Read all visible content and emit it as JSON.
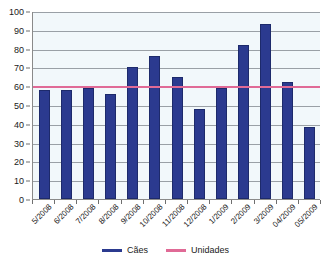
{
  "chart_data": {
    "type": "bar",
    "title": "",
    "xlabel": "",
    "ylabel": "",
    "ylim": [
      0,
      100
    ],
    "ytick_step": 10,
    "yticks": [
      0,
      10,
      20,
      30,
      40,
      50,
      60,
      70,
      80,
      90,
      100
    ],
    "grid": true,
    "legend_position": "bottom",
    "categories": [
      "5/2008",
      "6/2008",
      "7/2008",
      "8/2008",
      "9/2008",
      "10/2008",
      "11/2008",
      "12/2008",
      "1/2009",
      "2/2009",
      "3/2009",
      "04/2009",
      "05/2009"
    ],
    "series": [
      {
        "name": "Cães",
        "type": "bar",
        "color": "#2b3a8f",
        "values": [
          58,
          58,
          59,
          56,
          70,
          76,
          65,
          48,
          59,
          82,
          93,
          62,
          38.5
        ]
      },
      {
        "name": "Unidades",
        "type": "line",
        "color": "#e06a96",
        "constant_value": 60,
        "values": [
          60,
          60,
          60,
          60,
          60,
          60,
          60,
          60,
          60,
          60,
          60,
          60,
          60
        ]
      }
    ]
  },
  "legend": {
    "items": [
      {
        "label": "Cães",
        "color": "#2b3a8f",
        "style": "bar"
      },
      {
        "label": "Unidades",
        "color": "#e06a96",
        "style": "line"
      }
    ]
  },
  "colors": {
    "plot_background": "#f2f8fb",
    "gridline": "#9aa0a6",
    "axis": "#8a8a8a",
    "bar": "#2b3a8f",
    "threshold_line": "#e06a96",
    "text": "#1a1a1a"
  }
}
